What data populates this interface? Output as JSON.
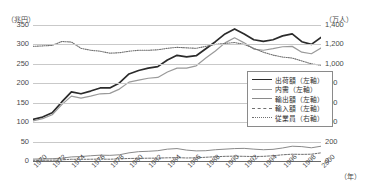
{
  "axes": {
    "left_unit": "（兆円）",
    "right_unit": "（万人）",
    "x_unit": "（年）",
    "left_ticks": [
      "350",
      "300",
      "250",
      "200",
      "150",
      "100",
      "50",
      "0"
    ],
    "right_ticks": [
      "1,400",
      "1,200",
      "1,000",
      "800",
      "600",
      "400",
      "200",
      "0"
    ],
    "x_ticks": [
      "1970",
      "1972",
      "1974",
      "1976",
      "1978",
      "1980",
      "1982",
      "1984",
      "1986",
      "1988",
      "1990",
      "1992",
      "1994",
      "1996",
      "1998",
      "2000"
    ]
  },
  "legend": {
    "items": [
      {
        "label": "出荷額（左軸）",
        "style": "solid-thick",
        "color": "#2b2b2b"
      },
      {
        "label": "内需（左軸）",
        "style": "solid-mid",
        "color": "#9a9a9a"
      },
      {
        "label": "輸出額（左軸）",
        "style": "solid-thin",
        "color": "#8a8a8a"
      },
      {
        "label": "輸入額（左軸）",
        "style": "dash",
        "color": "#6f6f6f"
      },
      {
        "label": "従業員（右軸）",
        "style": "dot",
        "color": "#6f6f6f"
      }
    ]
  },
  "chart_data": {
    "type": "line",
    "title": "",
    "xlabel": "（年）",
    "ylabel": "（兆円）",
    "y2label": "（万人）",
    "ylim": [
      0,
      350
    ],
    "y2lim": [
      0,
      1400
    ],
    "grid": true,
    "legend_position": "inside-right",
    "x": [
      1970,
      1971,
      1972,
      1973,
      1974,
      1975,
      1976,
      1977,
      1978,
      1979,
      1980,
      1981,
      1982,
      1983,
      1984,
      1985,
      1986,
      1987,
      1988,
      1989,
      1990,
      1991,
      1992,
      1993,
      1994,
      1995,
      1996,
      1997,
      1998,
      1999,
      2000
    ],
    "series": [
      {
        "name": "出荷額（左軸）",
        "axis": "left",
        "style": "solid-thick",
        "values": [
          107,
          113,
          124,
          152,
          178,
          173,
          180,
          188,
          188,
          201,
          224,
          233,
          239,
          243,
          260,
          272,
          268,
          271,
          289,
          307,
          327,
          340,
          327,
          312,
          308,
          312,
          322,
          327,
          307,
          300,
          318
        ]
      },
      {
        "name": "内需（左軸）",
        "axis": "left",
        "style": "solid-mid",
        "values": [
          103,
          109,
          119,
          145,
          167,
          162,
          167,
          173,
          174,
          185,
          203,
          208,
          213,
          215,
          229,
          239,
          239,
          245,
          265,
          283,
          304,
          317,
          304,
          288,
          285,
          289,
          294,
          295,
          280,
          276,
          291
        ]
      },
      {
        "name": "輸出額（左軸）",
        "axis": "left",
        "style": "solid-thin",
        "values": [
          5.0,
          5.5,
          6.0,
          7.2,
          10.5,
          11.5,
          13.5,
          15.0,
          14.5,
          16.0,
          21.0,
          24.0,
          25.0,
          26.5,
          30.5,
          32.0,
          28.0,
          26.0,
          26.5,
          29.0,
          30.5,
          32.0,
          32.5,
          30.5,
          29.0,
          30.0,
          33.5,
          38.0,
          37.0,
          34.0,
          38.0
        ]
      },
      {
        "name": "輸入額（左軸）",
        "axis": "left",
        "style": "dash",
        "values": [
          1.8,
          2.0,
          2.2,
          3.0,
          4.5,
          4.2,
          4.6,
          4.8,
          4.6,
          5.5,
          6.5,
          6.8,
          7.2,
          7.4,
          8.2,
          8.6,
          7.8,
          8.2,
          9.6,
          11.0,
          12.0,
          12.5,
          12.0,
          11.5,
          12.0,
          13.5,
          16.0,
          17.5,
          17.0,
          17.5,
          21.0
        ]
      },
      {
        "name": "従業員（右軸）",
        "axis": "right",
        "style": "dot",
        "values": [
          1180,
          1185,
          1190,
          1230,
          1225,
          1160,
          1140,
          1130,
          1110,
          1115,
          1130,
          1140,
          1140,
          1145,
          1160,
          1170,
          1165,
          1160,
          1180,
          1200,
          1210,
          1220,
          1200,
          1160,
          1120,
          1090,
          1070,
          1060,
          1030,
          1000,
          985
        ]
      }
    ]
  }
}
